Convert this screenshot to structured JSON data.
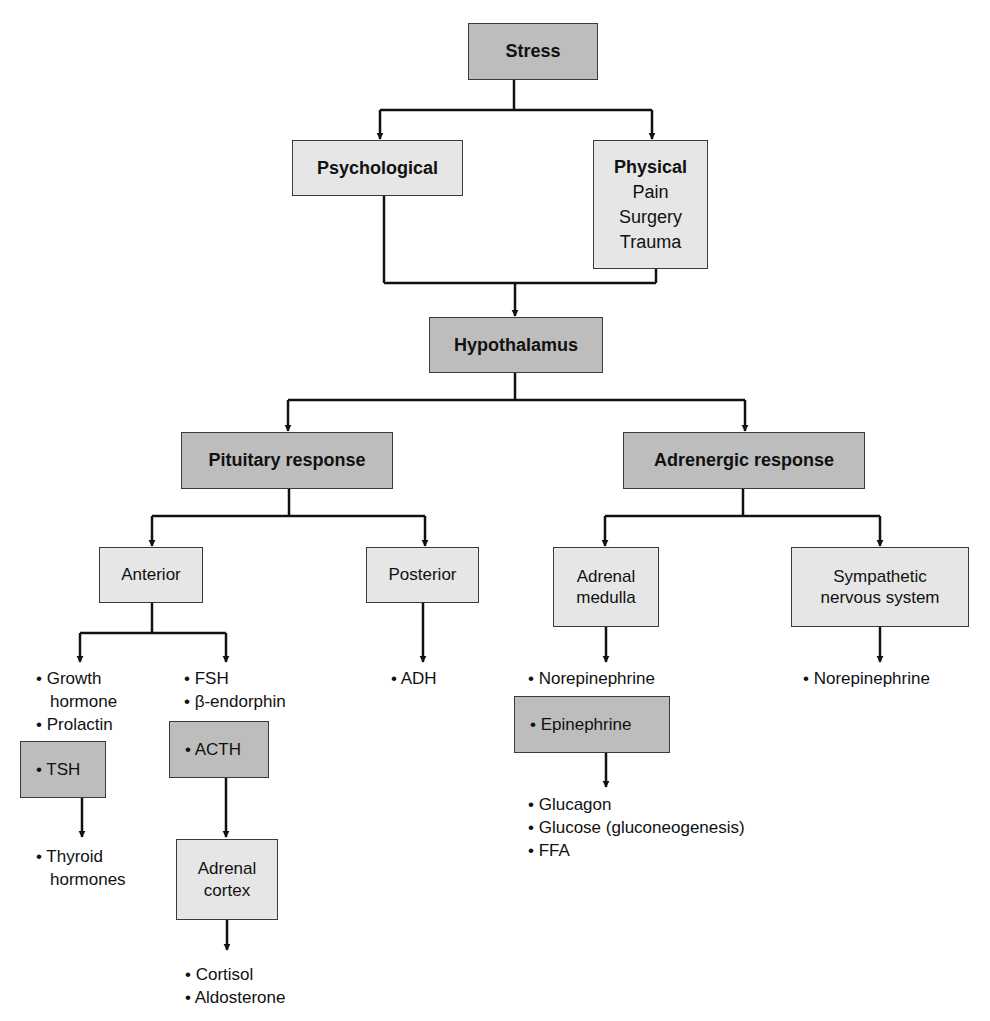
{
  "diagram": {
    "colors": {
      "dark_box": "#bdbdbd",
      "light_box": "#e6e6e6",
      "line": "#111111"
    },
    "stress": {
      "label": "Stress"
    },
    "psychological": {
      "label": "Psychological"
    },
    "physical": {
      "label": "Physical",
      "items": [
        "Pain",
        "Surgery",
        "Trauma"
      ]
    },
    "hypothalamus": {
      "label": "Hypothalamus"
    },
    "pituitary_response": {
      "label": "Pituitary response"
    },
    "adrenergic_response": {
      "label": "Adrenergic response"
    },
    "anterior": {
      "label": "Anterior"
    },
    "posterior": {
      "label": "Posterior"
    },
    "adrenal_medulla": {
      "label_line1": "Adrenal",
      "label_line2": "medulla"
    },
    "sympathetic": {
      "label_line1": "Sympathetic",
      "label_line2": "nervous system"
    },
    "anterior_left_list": {
      "item1_line1": "• Growth",
      "item1_line2": "hormone",
      "item2": "• Prolactin"
    },
    "tsh": {
      "label": "• TSH"
    },
    "thyroid": {
      "line1": "• Thyroid",
      "line2": "hormones"
    },
    "anterior_right_list": {
      "item1": "• FSH",
      "item2": "• β-endorphin"
    },
    "acth": {
      "label": "• ACTH"
    },
    "adrenal_cortex": {
      "label_line1": "Adrenal",
      "label_line2": "cortex"
    },
    "cortex_outputs": {
      "item1": "• Cortisol",
      "item2": "• Aldosterone"
    },
    "posterior_outputs": {
      "item1": "• ADH"
    },
    "medulla_outputs": {
      "item1": "• Norepinephrine"
    },
    "epinephrine": {
      "label": "• Epinephrine"
    },
    "epinephrine_outputs": {
      "item1": "• Glucagon",
      "item2": "• Glucose (gluconeogenesis)",
      "item3": "• FFA"
    },
    "sympathetic_outputs": {
      "item1": "• Norepinephrine"
    }
  }
}
